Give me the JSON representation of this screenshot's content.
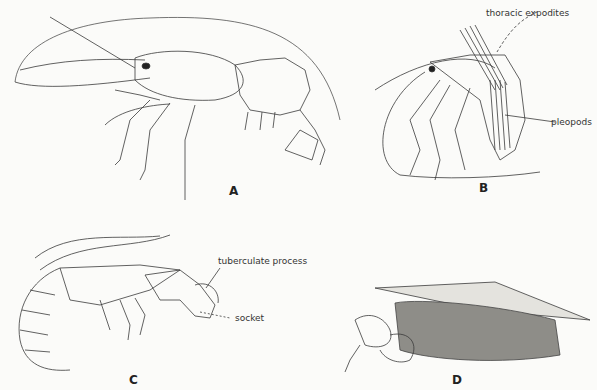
{
  "figure": {
    "panels": [
      {
        "letter": "A",
        "subject": "shrimp-lateral-view",
        "labels": []
      },
      {
        "letter": "B",
        "subject": "shrimp-with-expodites",
        "labels": [
          "thoracic expodites",
          "pleopods"
        ]
      },
      {
        "letter": "C",
        "subject": "snapping-shrimp",
        "labels": [
          "tuberculate process",
          "socket"
        ]
      },
      {
        "letter": "D",
        "subject": "shrimp-in-burrow-tube",
        "labels": []
      }
    ],
    "colors": {
      "background": "#fbfbf9",
      "ink": "#333333"
    }
  }
}
